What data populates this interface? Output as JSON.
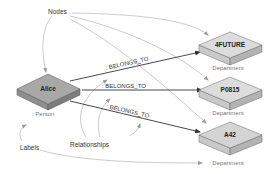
{
  "annotations": {
    "nodes": "Nodes",
    "labels": "Labels",
    "relationships": "Relationships"
  },
  "nodes": [
    {
      "name": "Alice",
      "label": ": Person",
      "fill": "#a6a6a6",
      "side": "#8c8c8c"
    },
    {
      "name": "4FUTURE",
      "label": ": Department",
      "fill": "#d9d9d9",
      "side": "#bdbdbd"
    },
    {
      "name": "P0815",
      "label": ": Department",
      "fill": "#d9d9d9",
      "side": "#bdbdbd"
    },
    {
      "name": "A42",
      "label": ": Department",
      "fill": "#d9d9d9",
      "side": "#bdbdbd"
    }
  ],
  "relationships": [
    {
      "type": ": BELONGS_TO",
      "from": "Alice",
      "to": "4FUTURE"
    },
    {
      "type": ": BELONGS_TO",
      "from": "Alice",
      "to": "P0815"
    },
    {
      "type": ": BELONGS_TO",
      "from": "Alice",
      "to": "A42"
    }
  ],
  "colors": {
    "edge": "#333333",
    "pointer": "#999999",
    "annotation_text": "#333333",
    "label_text": "#777777"
  }
}
